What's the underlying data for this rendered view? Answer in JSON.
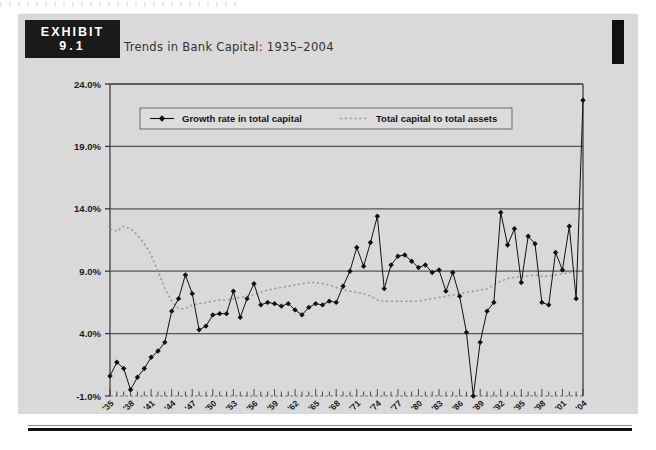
{
  "exhibit": {
    "badge_word": "EXHIBIT",
    "badge_number": "9.1",
    "title": "Trends in Bank Capital: 1935–2004"
  },
  "legend": {
    "series1_label": "Growth rate in total capital",
    "series2_label": "Total capital to total assets"
  },
  "colors": {
    "page": "#ffffff",
    "sheet": "#d9d9d9",
    "ink": "#1a1a1a",
    "axis": "#4a4a4a",
    "gridline": "#555555",
    "series1": "#111111",
    "series2": "#9a9a9a"
  },
  "chart_data": {
    "type": "line",
    "title": "Trends in Bank Capital: 1935–2004",
    "xlabel": "",
    "ylabel": "",
    "ylim": [
      -1.0,
      24.0
    ],
    "yticks": [
      -1.0,
      4.0,
      9.0,
      14.0,
      19.0,
      24.0
    ],
    "ytick_labels": [
      "-1.0%",
      "4.0%",
      "9.0%",
      "14.0%",
      "19.0%",
      "24.0%"
    ],
    "grid": true,
    "legend_position": "top-left-inside",
    "x": [
      1935,
      1936,
      1937,
      1938,
      1939,
      1940,
      1941,
      1942,
      1943,
      1944,
      1945,
      1946,
      1947,
      1948,
      1949,
      1950,
      1951,
      1952,
      1953,
      1954,
      1955,
      1956,
      1957,
      1958,
      1959,
      1960,
      1961,
      1962,
      1963,
      1964,
      1965,
      1966,
      1967,
      1968,
      1969,
      1970,
      1971,
      1972,
      1973,
      1974,
      1975,
      1976,
      1977,
      1978,
      1979,
      1980,
      1981,
      1982,
      1983,
      1984,
      1985,
      1986,
      1987,
      1988,
      1989,
      1990,
      1991,
      1992,
      1993,
      1994,
      1995,
      1996,
      1997,
      1998,
      1999,
      2000,
      2001,
      2002,
      2003,
      2004
    ],
    "xtick_labels": [
      "'35",
      "'38",
      "'41",
      "'44",
      "'47",
      "'50",
      "'53",
      "'56",
      "'59",
      "'62",
      "'65",
      "'68",
      "'71",
      "'74",
      "'77",
      "'80",
      "'83",
      "'86",
      "'89",
      "'92",
      "'95",
      "'98",
      "'01",
      "'04"
    ],
    "xtick_years": [
      1935,
      1938,
      1941,
      1944,
      1947,
      1950,
      1953,
      1956,
      1959,
      1962,
      1965,
      1968,
      1971,
      1974,
      1977,
      1980,
      1983,
      1986,
      1989,
      1992,
      1995,
      1998,
      2001,
      2004
    ],
    "series": [
      {
        "name": "Growth rate in total capital",
        "marker": "diamond",
        "linestyle": "solid",
        "color": "#111111",
        "values": [
          0.6,
          1.7,
          1.2,
          -0.5,
          0.5,
          1.2,
          2.1,
          2.6,
          3.3,
          5.8,
          6.8,
          8.7,
          7.2,
          4.3,
          4.6,
          5.5,
          5.6,
          5.6,
          7.4,
          5.3,
          6.8,
          8.0,
          6.3,
          6.5,
          6.4,
          6.2,
          6.4,
          5.9,
          5.5,
          6.1,
          6.4,
          6.3,
          6.6,
          6.5,
          7.8,
          9.0,
          10.9,
          9.4,
          11.3,
          13.4,
          7.6,
          9.5,
          10.2,
          10.3,
          9.8,
          9.3,
          9.5,
          8.9,
          9.1,
          7.4,
          8.9,
          7.0,
          4.1,
          -1.0,
          3.3,
          5.8,
          6.5,
          13.7,
          11.1,
          12.4,
          8.1,
          11.8,
          11.2,
          6.5,
          6.3,
          10.5,
          9.1,
          12.6,
          6.8,
          22.7
        ]
      },
      {
        "name": "Total capital to total assets",
        "marker": "none",
        "linestyle": "dotted",
        "color": "#9a9a9a",
        "values": [
          12.4,
          12.2,
          12.6,
          12.4,
          11.9,
          11.2,
          10.3,
          9.0,
          7.6,
          6.6,
          6.0,
          6.0,
          6.3,
          6.4,
          6.5,
          6.6,
          6.7,
          6.7,
          6.8,
          6.9,
          7.0,
          7.1,
          7.3,
          7.5,
          7.6,
          7.7,
          7.8,
          7.9,
          8.0,
          8.1,
          8.1,
          8.0,
          7.9,
          7.7,
          7.5,
          7.4,
          7.3,
          7.2,
          7.0,
          6.7,
          6.6,
          6.6,
          6.6,
          6.6,
          6.6,
          6.6,
          6.7,
          6.8,
          6.9,
          7.0,
          7.1,
          7.2,
          7.3,
          7.4,
          7.5,
          7.6,
          7.9,
          8.2,
          8.4,
          8.5,
          8.6,
          8.6,
          8.7,
          8.6,
          8.6,
          8.7,
          8.8,
          8.9,
          9.0,
          9.1
        ]
      }
    ]
  }
}
